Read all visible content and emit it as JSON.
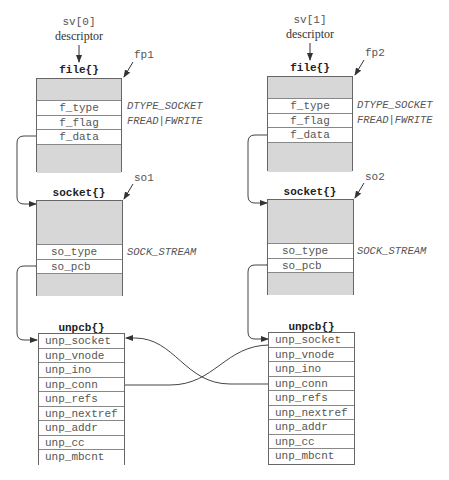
{
  "left": {
    "descriptor": {
      "name": "sv[0]",
      "caption": "descriptor"
    },
    "file": {
      "title": "file{}",
      "pointer": "fp1",
      "fields": [
        {
          "name": "f_type",
          "value": "DTYPE_SOCKET"
        },
        {
          "name": "f_flag",
          "value": "FREAD|FWRITE"
        },
        {
          "name": "f_data",
          "value": ""
        }
      ]
    },
    "socket": {
      "title": "socket{}",
      "pointer": "so1",
      "fields": [
        {
          "name": "so_type",
          "value": "SOCK_STREAM"
        },
        {
          "name": "so_pcb",
          "value": ""
        }
      ]
    },
    "unpcb": {
      "title": "unpcb{}",
      "fields": [
        "unp_socket",
        "unp_vnode",
        "unp_ino",
        "unp_conn",
        "unp_refs",
        "unp_nextref",
        "unp_addr",
        "unp_cc",
        "unp_mbcnt"
      ]
    }
  },
  "right": {
    "descriptor": {
      "name": "sv[1]",
      "caption": "descriptor"
    },
    "file": {
      "title": "file{}",
      "pointer": "fp2",
      "fields": [
        {
          "name": "f_type",
          "value": "DTYPE_SOCKET"
        },
        {
          "name": "f_flag",
          "value": "FREAD|FWRITE"
        },
        {
          "name": "f_data",
          "value": ""
        }
      ]
    },
    "socket": {
      "title": "socket{}",
      "pointer": "so2",
      "fields": [
        {
          "name": "so_type",
          "value": "SOCK_STREAM"
        },
        {
          "name": "so_pcb",
          "value": ""
        }
      ]
    },
    "unpcb": {
      "title": "unpcb{}",
      "fields": [
        "unp_socket",
        "unp_vnode",
        "unp_ino",
        "unp_conn",
        "unp_refs",
        "unp_nextref",
        "unp_addr",
        "unp_cc",
        "unp_mbcnt"
      ]
    }
  },
  "colors": {
    "box_fill": "#d7d7d7",
    "line": "#444444",
    "text": "#555555"
  }
}
